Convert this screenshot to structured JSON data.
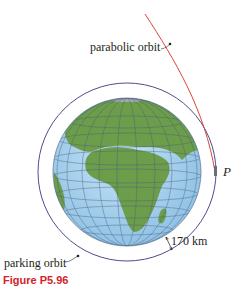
{
  "figure": {
    "caption": "Figure P5.96",
    "labels": {
      "parabolic_orbit": "parabolic orbit",
      "parking_orbit": "parking orbit",
      "altitude": "170 km",
      "point": "P"
    },
    "colors": {
      "parabolic_orbit": "#d9463a",
      "parking_orbit": "#4a4f8f",
      "ocean": "#a9d3ee",
      "land": "#6d9d4a",
      "caption": "#d2232a"
    }
  }
}
